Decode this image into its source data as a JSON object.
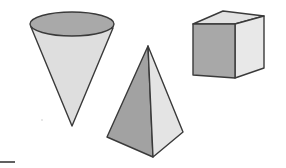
{
  "figure": {
    "background": "#ffffff",
    "stroke_color": "#3a3a3a",
    "shapes": [
      {
        "name": "cone",
        "orientation": "inverted (apex down)",
        "top_fill": "#a9a9a9",
        "body_fill": "#dedede"
      },
      {
        "name": "square-pyramid",
        "orientation": "apex up",
        "left_face_fill": "#a2a2a2",
        "right_face_fill": "#e4e4e4"
      },
      {
        "name": "cube",
        "front_face_fill": "#a8a8a8",
        "top_face_fill": "#e2e2e2",
        "right_face_fill": "#e8e8e8"
      }
    ],
    "marks": [
      {
        "name": "bottom-left-dash"
      }
    ]
  }
}
